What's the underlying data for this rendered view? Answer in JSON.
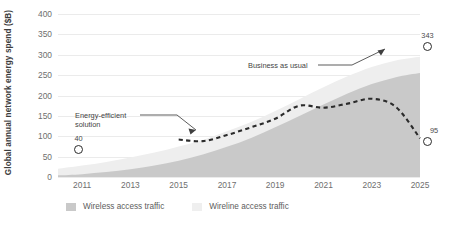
{
  "chart_data": {
    "type": "area",
    "title": "",
    "subtitle": "",
    "xlabel": "",
    "ylabel": "Global annual network energy spend ($B)",
    "xlim": [
      2010,
      2025
    ],
    "ylim": [
      0,
      400
    ],
    "y_ticks": [
      0,
      50,
      100,
      150,
      200,
      250,
      300,
      350,
      400
    ],
    "x_ticks": [
      2011,
      2013,
      2015,
      2017,
      2019,
      2021,
      2023,
      2025
    ],
    "grid": true,
    "legend_position": "bottom-left",
    "stacked": true,
    "x": [
      2010,
      2011,
      2012,
      2013,
      2014,
      2015,
      2016,
      2017,
      2018,
      2019,
      2020,
      2021,
      2022,
      2023,
      2024,
      2025
    ],
    "series": [
      {
        "name": "Wireless access traffic",
        "color": "#c9c9c9",
        "values": [
          4,
          7,
          12,
          19,
          28,
          40,
          55,
          74,
          96,
          122,
          150,
          178,
          205,
          228,
          245,
          255
        ]
      },
      {
        "name": "Wireline access traffic",
        "color": "#eeeeee",
        "values": [
          16,
          21,
          25,
          29,
          32,
          35,
          36,
          38,
          39,
          40,
          41,
          42,
          42,
          42,
          41,
          40
        ]
      }
    ],
    "lines": [
      {
        "name": "Energy-efficient solution",
        "style": "dashed",
        "color": "#2b2b2b",
        "x": [
          2015,
          2016,
          2017,
          2018,
          2019,
          2020,
          2021,
          2022,
          2023,
          2024,
          2025
        ],
        "values": [
          92,
          88,
          103,
          122,
          143,
          175,
          170,
          180,
          192,
          172,
          95
        ]
      }
    ],
    "markers": [
      {
        "name": "start-marker",
        "x": 2011,
        "value": 40,
        "label": "40"
      },
      {
        "name": "business-as-usual-end-marker",
        "x": 2025,
        "value": 343,
        "label": "343"
      },
      {
        "name": "energy-efficient-end-marker",
        "x": 2025,
        "value": 95,
        "label": "95"
      }
    ],
    "annotations": [
      {
        "name": "business-as-usual",
        "text": "Business as usual"
      },
      {
        "name": "energy-efficient-solution",
        "text_line1": "Energy-efficient",
        "text_line2": "solution"
      }
    ]
  },
  "legend": {
    "items": [
      {
        "label": "Wireless access traffic",
        "color": "#c9c9c9"
      },
      {
        "label": "Wireline access traffic",
        "color": "#efefef"
      }
    ]
  }
}
